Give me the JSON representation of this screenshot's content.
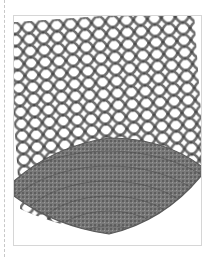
{
  "figure": {
    "colors": {
      "background": "#ffffff",
      "frame_border": "#d6d6d6",
      "yarn": "#6e6e6e",
      "yarn_dark": "#4a4a4a",
      "base_fill": "#7a7a7a",
      "dashed_guide": "#c8c8c8"
    }
  }
}
